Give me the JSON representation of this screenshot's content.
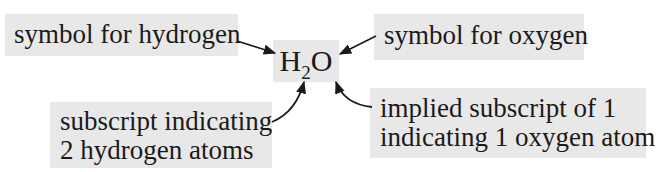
{
  "diagram": {
    "formula": {
      "element1": "H",
      "subscript1": "2",
      "element2": "O"
    },
    "labels": {
      "hydrogen_symbol": "symbol for hydrogen",
      "oxygen_symbol": "symbol for oxygen",
      "subscript_line1": "subscript indicating",
      "subscript_line2": "2 hydrogen atoms",
      "implied_line1": "implied subscript of 1",
      "implied_line2": "indicating 1 oxygen atom"
    },
    "colors": {
      "label_background": "#e8e8e8",
      "text": "#1a1a1a",
      "arrow": "#1a1a1a"
    }
  }
}
